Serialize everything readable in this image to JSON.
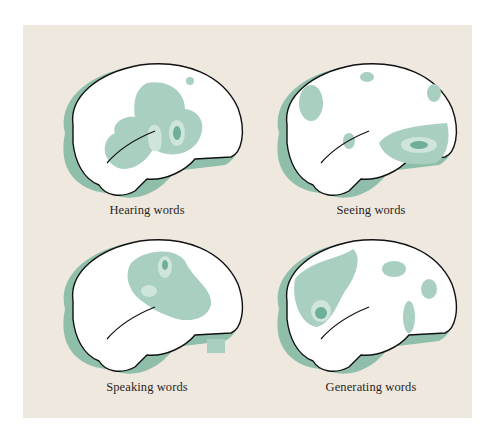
{
  "figure": {
    "background_color": "#efe8df",
    "brain_fill": "#ffffff",
    "activation_color_light": "#a9cfc1",
    "activation_color_mid": "#cfe5dc",
    "activation_color_dark": "#6fae98",
    "shadow_color": "#8fbfaa",
    "panels": [
      {
        "label": "Hearing words"
      },
      {
        "label": "Seeing words"
      },
      {
        "label": "Speaking words"
      },
      {
        "label": "Generating words"
      }
    ]
  }
}
